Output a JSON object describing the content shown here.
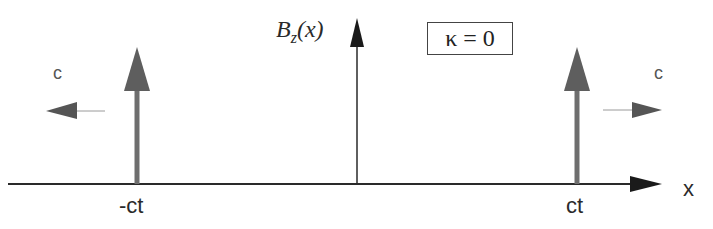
{
  "diagram": {
    "y_axis_label": "B",
    "y_axis_label_sub": "z",
    "y_axis_label_arg": "(x)",
    "x_axis_label": "x",
    "parameter_box": "κ  =  0",
    "left_pulse_label": "-ct",
    "right_pulse_label": "ct",
    "left_velocity_label": "c",
    "right_velocity_label": "c",
    "colors": {
      "axis": "#2a2a2a",
      "pulse": "#6e6e6e",
      "velocity_arrow": "#555555",
      "thin_line": "#9a9a9a"
    }
  }
}
